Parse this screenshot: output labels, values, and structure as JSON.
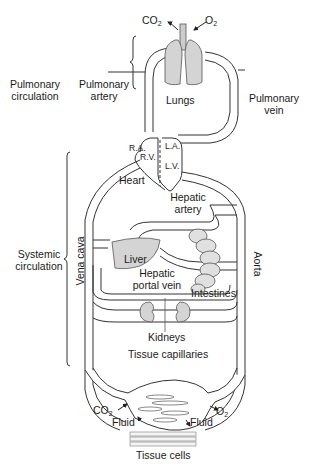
{
  "diagram": {
    "type": "circulatory-system-schematic",
    "groups": {
      "pulmonary": "Pulmonary\ncirculation",
      "systemic": "Systemic\ncirculation"
    },
    "labels": {
      "co2_top": "CO",
      "o2_top": "O",
      "lungs": "Lungs",
      "pulmonary_artery_1": "Pulmonary",
      "pulmonary_artery_2": "artery",
      "pulmonary_vein_1": "Pulmonary",
      "pulmonary_vein_2": "vein",
      "pulmonary_circ_1": "Pulmonary",
      "pulmonary_circ_2": "circulation",
      "ra": "R.A.",
      "rv": "R.V.",
      "la": "L.A.",
      "lv": "L.V.",
      "heart": "Heart",
      "hepatic_artery_1": "Hepatic",
      "hepatic_artery_2": "artery",
      "systemic_circ_1": "Systemic",
      "systemic_circ_2": "circulation",
      "vena_cava": "Vena cava",
      "aorta": "Aorta",
      "liver": "Liver",
      "hepatic_portal_1": "Hepatic",
      "hepatic_portal_2": "portal vein",
      "intestines": "Intestines",
      "kidneys": "Kidneys",
      "tissue_capillaries": "Tissue capillaries",
      "co2_bottom": "CO",
      "o2_bottom": "O",
      "fluid_left": "Fluid",
      "fluid_right": "Fluid",
      "tissue_cells": "Tissue cells",
      "subscript_2": "2"
    }
  }
}
